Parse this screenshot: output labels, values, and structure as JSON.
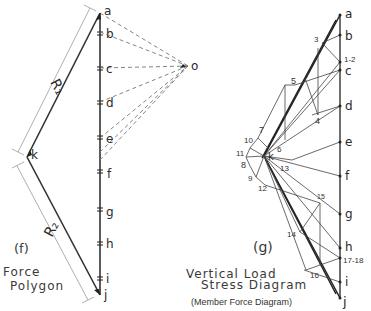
{
  "force_polygon": {
    "figure_label": "(f)",
    "caption_line1": "Force",
    "caption_line2": "Polygon",
    "pole_label": "o",
    "closing_point_label": "k",
    "reaction_labels": [
      "R₁",
      "R₂"
    ],
    "load_points": [
      {
        "label": "a",
        "y": 13
      },
      {
        "label": "b",
        "y": 32
      },
      {
        "label": "c",
        "y": 68
      },
      {
        "label": "d",
        "y": 102
      },
      {
        "label": "e",
        "y": 138
      },
      {
        "label": "f",
        "y": 172
      },
      {
        "label": "g",
        "y": 210
      },
      {
        "label": "h",
        "y": 243
      },
      {
        "label": "i",
        "y": 279
      },
      {
        "label": "j",
        "y": 295
      }
    ]
  },
  "stress_diagram": {
    "figure_label": "(g)",
    "caption_line1": "Vertical Load",
    "caption_line2": "Stress Diagram",
    "subcaption": "(Member Force Diagram)",
    "center_label": "k",
    "load_points": [
      {
        "label": "a",
        "y": 15
      },
      {
        "label": "b",
        "y": 35
      },
      {
        "label": "c",
        "y": 70
      },
      {
        "label": "d",
        "y": 106
      },
      {
        "label": "e",
        "y": 142
      },
      {
        "label": "f",
        "y": 176
      },
      {
        "label": "g",
        "y": 214
      },
      {
        "label": "h",
        "y": 248
      },
      {
        "label": "i",
        "y": 282
      },
      {
        "label": "j",
        "y": 298
      }
    ],
    "node_labels": [
      {
        "label": "1-2",
        "x": 344,
        "y": 63
      },
      {
        "label": "3",
        "x": 318,
        "y": 44
      },
      {
        "label": "4",
        "x": 316,
        "y": 120
      },
      {
        "label": "5",
        "x": 293,
        "y": 84
      },
      {
        "label": "6",
        "x": 278,
        "y": 151
      },
      {
        "label": "7",
        "x": 260,
        "y": 132
      },
      {
        "label": "8",
        "x": 243,
        "y": 167
      },
      {
        "label": "9",
        "x": 251,
        "y": 180
      },
      {
        "label": "10",
        "x": 244,
        "y": 142
      },
      {
        "label": "11",
        "x": 240,
        "y": 155
      },
      {
        "label": "12",
        "x": 261,
        "y": 190
      },
      {
        "label": "13",
        "x": 280,
        "y": 170
      },
      {
        "label": "14",
        "x": 290,
        "y": 236
      },
      {
        "label": "15",
        "x": 318,
        "y": 198
      },
      {
        "label": "16",
        "x": 312,
        "y": 276
      },
      {
        "label": "17-18",
        "x": 343,
        "y": 260
      }
    ]
  }
}
